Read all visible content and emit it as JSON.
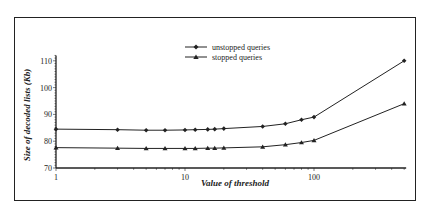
{
  "chart_data": {
    "type": "line",
    "title": "",
    "xlabel": "Value of threshold",
    "ylabel": "Size of decoded lists (Kb)",
    "xscale": "log",
    "xlim": [
      1,
      500
    ],
    "ylim": [
      70,
      112
    ],
    "x_ticks": [
      "1",
      "10",
      "100"
    ],
    "y_ticks": [
      "70",
      "80",
      "90",
      "100",
      "110"
    ],
    "legend": [
      "unstopped queries",
      "stopped queries"
    ],
    "legend_position": "top-center",
    "grid": false,
    "x": [
      1,
      3,
      5,
      7,
      10,
      12,
      15,
      17,
      20,
      40,
      60,
      80,
      100,
      500
    ],
    "series": [
      {
        "name": "unstopped queries",
        "marker": "diamond",
        "values": [
          84.5,
          84.3,
          84.1,
          84.1,
          84.2,
          84.3,
          84.4,
          84.5,
          84.7,
          85.5,
          86.5,
          88.0,
          89.0,
          110.0
        ]
      },
      {
        "name": "stopped queries",
        "marker": "triangle",
        "values": [
          77.6,
          77.4,
          77.3,
          77.3,
          77.3,
          77.3,
          77.4,
          77.4,
          77.5,
          77.9,
          78.7,
          79.5,
          80.3,
          94.0
        ]
      }
    ]
  }
}
